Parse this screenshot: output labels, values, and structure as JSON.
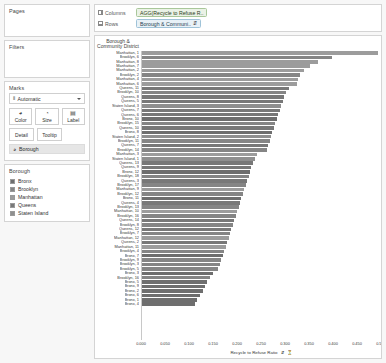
{
  "sidebar": {
    "pages": {
      "title": "Pages"
    },
    "filters": {
      "title": "Filters"
    },
    "marks": {
      "title": "Marks",
      "type_icon": "bar-mark-icon",
      "type_label": "Automatic",
      "buttons": [
        {
          "label": "Color",
          "icon": "color-icon"
        },
        {
          "label": "Size",
          "icon": "size-icon"
        },
        {
          "label": "Label",
          "icon": "label-icon"
        },
        {
          "label": "Detail",
          "icon": "detail-icon"
        },
        {
          "label": "Tooltip",
          "icon": "tooltip-icon"
        }
      ],
      "color_pill": {
        "label": "Borough",
        "icon": "color-dimension-icon"
      }
    },
    "legend": {
      "title": "Borough",
      "items": [
        {
          "label": "Bronx",
          "color": "#6e6e6e"
        },
        {
          "label": "Brooklyn",
          "color": "#858585"
        },
        {
          "label": "Manhattan",
          "color": "#9c9c9c"
        },
        {
          "label": "Queens",
          "color": "#787878"
        },
        {
          "label": "Staten Island",
          "color": "#8f8f8f"
        }
      ]
    }
  },
  "shelves": {
    "columns": {
      "label": "Columns",
      "pill": "AGG(Recycle to Refuse R..",
      "icon": "columns-grid-icon"
    },
    "rows": {
      "label": "Rows",
      "pill": "Borough & Communi..",
      "pill_sort_icon": "sort-descending-icon",
      "icon": "rows-grid-icon"
    }
  },
  "chart_data": {
    "type": "bar",
    "title": "",
    "row_header": "Borough & Community District",
    "xlabel": "Recycle to Refuse Ratio",
    "ylabel": "",
    "xlim": [
      0,
      0.5
    ],
    "grid": false,
    "legend_position": "left-sidebar",
    "orientation": "horizontal",
    "sort": "descending",
    "axis_title_icons": [
      "sort-descending-icon",
      "filter-icon"
    ],
    "xticks": [
      "0.000",
      "0.050",
      "0.100",
      "0.150",
      "0.200",
      "0.250",
      "0.300",
      "0.350",
      "0.400",
      "0.450",
      "0.500"
    ],
    "xtick_values": [
      0,
      0.05,
      0.1,
      0.15,
      0.2,
      0.25,
      0.3,
      0.35,
      0.4,
      0.45,
      0.5
    ],
    "categories": [
      "Manhattan, 1",
      "Brooklyn, 6",
      "Manhattan, 8",
      "Manhattan, 7",
      "Manhattan, 2",
      "Brooklyn, 2",
      "Manhattan, 4",
      "Manhattan, 6",
      "Queens, 11",
      "Brooklyn, 10",
      "Queens, 8",
      "Queens, 5",
      "Staten Island, 3",
      "Queens, 7",
      "Queens, 6",
      "Bronx, 10",
      "Brooklyn, 15",
      "Queens, 10",
      "Bronx, 8",
      "Staten Island, 2",
      "Brooklyn, 11",
      "Queens, 7",
      "Brooklyn, 14",
      "Manhattan, 3",
      "Staten Island, 1",
      "Queens, 13",
      "Queens, 9",
      "Bronx, 12",
      "Brooklyn, 18",
      "Queens, 3",
      "Brooklyn, 17",
      "Manhattan, 9",
      "Brooklyn, 12",
      "Bronx, 11",
      "Queens, 4",
      "Brooklyn, 13",
      "Manhattan, 10",
      "Brooklyn, 16",
      "Queens, 14",
      "Brooklyn, 8",
      "Queens, 12",
      "Brooklyn, 7",
      "Manhattan, 12",
      "Queens, 2",
      "Manhattan, 11",
      "Brooklyn, 4",
      "Bronx, 7",
      "Brooklyn, 9",
      "Brooklyn, 3",
      "Brooklyn, 5",
      "Bronx, 3",
      "Brooklyn, 16",
      "Bronx, 5",
      "Bronx, 9",
      "Bronx, 2",
      "Bronx, 6",
      "Bronx, 1",
      "Bronx, 4"
    ],
    "values": [
      0.493,
      0.398,
      0.368,
      0.352,
      0.338,
      0.331,
      0.327,
      0.324,
      0.308,
      0.302,
      0.298,
      0.294,
      0.291,
      0.288,
      0.285,
      0.282,
      0.279,
      0.276,
      0.273,
      0.27,
      0.267,
      0.264,
      0.261,
      0.24,
      0.236,
      0.232,
      0.229,
      0.226,
      0.223,
      0.22,
      0.217,
      0.214,
      0.211,
      0.208,
      0.205,
      0.202,
      0.199,
      0.196,
      0.193,
      0.19,
      0.187,
      0.184,
      0.181,
      0.178,
      0.175,
      0.172,
      0.169,
      0.166,
      0.163,
      0.16,
      0.148,
      0.142,
      0.137,
      0.132,
      0.127,
      0.121,
      0.116,
      0.11
    ],
    "bar_colors": [
      "#9c9c9c",
      "#858585",
      "#9c9c9c",
      "#9c9c9c",
      "#9c9c9c",
      "#858585",
      "#9c9c9c",
      "#9c9c9c",
      "#787878",
      "#858585",
      "#787878",
      "#787878",
      "#8f8f8f",
      "#787878",
      "#787878",
      "#6e6e6e",
      "#858585",
      "#787878",
      "#6e6e6e",
      "#8f8f8f",
      "#858585",
      "#787878",
      "#858585",
      "#9c9c9c",
      "#8f8f8f",
      "#787878",
      "#787878",
      "#6e6e6e",
      "#858585",
      "#787878",
      "#858585",
      "#9c9c9c",
      "#858585",
      "#6e6e6e",
      "#787878",
      "#858585",
      "#9c9c9c",
      "#858585",
      "#787878",
      "#858585",
      "#787878",
      "#858585",
      "#9c9c9c",
      "#787878",
      "#9c9c9c",
      "#858585",
      "#6e6e6e",
      "#858585",
      "#858585",
      "#858585",
      "#6e6e6e",
      "#858585",
      "#6e6e6e",
      "#6e6e6e",
      "#6e6e6e",
      "#6e6e6e",
      "#6e6e6e",
      "#6e6e6e"
    ]
  }
}
